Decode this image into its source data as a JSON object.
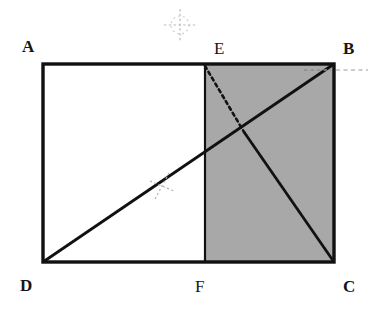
{
  "figure": {
    "background_color": "#ffffff",
    "stroke_color": "#111111",
    "shaded_fill_color": "#a8a8a8",
    "faint_mark_color": "#b9b9b9",
    "rectangle": {
      "A": {
        "x": 43,
        "y": 64
      },
      "B": {
        "x": 334,
        "y": 64
      },
      "C": {
        "x": 334,
        "y": 262
      },
      "D": {
        "x": 43,
        "y": 262
      }
    },
    "points": {
      "E": {
        "x": 205,
        "y": 64
      },
      "F": {
        "x": 205,
        "y": 262
      },
      "intersection": {
        "x": 244,
        "y": 132
      }
    },
    "labels": {
      "A": "A",
      "B": "B",
      "C": "C",
      "D": "D",
      "E": "E",
      "F": "F"
    },
    "segments": {
      "diagonal_DB": {
        "from": "D",
        "to": "B",
        "style": "solid"
      },
      "line_EF": {
        "from": "E",
        "to": "F",
        "style": "solid"
      },
      "line_E_to_intersection": {
        "from": "E",
        "to": "intersection",
        "style": "dashed"
      },
      "line_intersection_to_C": {
        "from": "intersection",
        "to": "C",
        "style": "solid"
      }
    },
    "shaded_region": {
      "vertices": [
        "E",
        "B",
        "C",
        "F"
      ],
      "fill": "#a8a8a8"
    },
    "faint_marks": [
      {
        "name": "registration-cross",
        "x": 180,
        "y": 25,
        "arm_length": 16,
        "rotation": 0
      },
      {
        "name": "diagonal-tick-mark",
        "x": 162,
        "y": 186,
        "arm_length": 13,
        "rotation": 20
      },
      {
        "name": "corner-dash-B",
        "x1": 336,
        "y1": 70,
        "x2": 368,
        "y2": 70
      }
    ]
  }
}
